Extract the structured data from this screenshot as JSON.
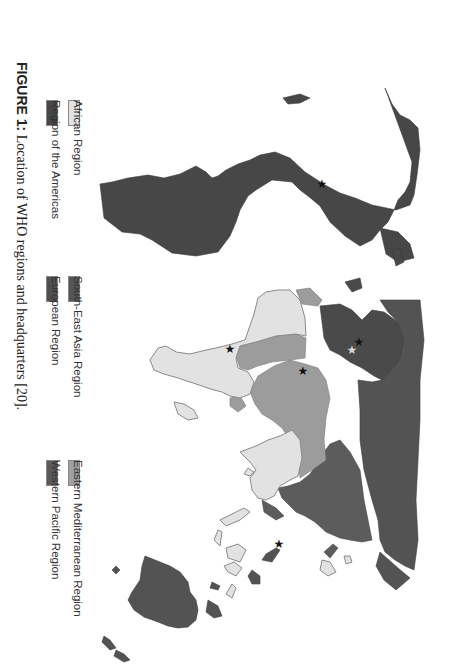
{
  "figure": {
    "label": "FIGURE 1:",
    "caption": " Location of WHO regions and headquarters [20]."
  },
  "legend": {
    "items": [
      {
        "name": "African Region",
        "color": "#e2e2e2"
      },
      {
        "name": "Region of the Americas",
        "color": "#474747"
      },
      {
        "name": "South-East Asia Region",
        "color": "#555555"
      },
      {
        "name": "European Region",
        "color": "#4f4f4f"
      },
      {
        "name": "Eastern Mediterranean Region",
        "color": "#a0a0a0"
      },
      {
        "name": "Western Pacific Region",
        "color": "#5a5a5a"
      }
    ]
  },
  "map": {
    "orientation": "rotated 90 degrees clockwise",
    "markers": [
      {
        "type": "headquarters",
        "symbol": "★",
        "color": "#111111"
      },
      {
        "type": "regional-office",
        "symbol": "★",
        "color": "#d8d8d8"
      }
    ]
  }
}
